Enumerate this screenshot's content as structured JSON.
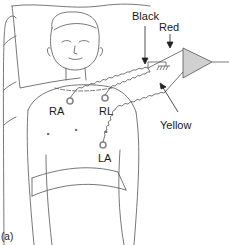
{
  "figure": {
    "panel_label": "(a)",
    "electrodes": [
      {
        "label": "RA",
        "x": 70,
        "y": 100
      },
      {
        "label": "RL",
        "x": 105,
        "y": 99
      },
      {
        "label": "LA",
        "x": 103,
        "y": 146
      }
    ],
    "lead_wires": [
      {
        "label": "Black"
      },
      {
        "label": "Red"
      },
      {
        "label": "Yellow"
      }
    ],
    "amplifier": {
      "shape": "triangle",
      "fill": "#d0d0d0"
    },
    "ground_symbol": "ground-icon",
    "colors": {
      "line": "#555555",
      "electrode": "#888888",
      "amp_fill": "#d0d0d0"
    }
  }
}
